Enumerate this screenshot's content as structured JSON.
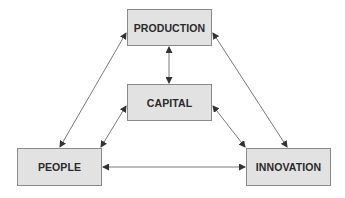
{
  "diagram": {
    "type": "relationship-triangle",
    "nodes": {
      "production": {
        "label": "PRODUCTION"
      },
      "capital": {
        "label": "CAPITAL"
      },
      "people": {
        "label": "PEOPLE"
      },
      "innovation": {
        "label": "INNOVATION"
      }
    },
    "edges": [
      {
        "from": "PRODUCTION",
        "to": "CAPITAL",
        "direction": "bidirectional"
      },
      {
        "from": "PRODUCTION",
        "to": "PEOPLE",
        "direction": "bidirectional"
      },
      {
        "from": "PRODUCTION",
        "to": "INNOVATION",
        "direction": "bidirectional"
      },
      {
        "from": "CAPITAL",
        "to": "PEOPLE",
        "direction": "bidirectional"
      },
      {
        "from": "CAPITAL",
        "to": "INNOVATION",
        "direction": "bidirectional"
      },
      {
        "from": "PEOPLE",
        "to": "INNOVATION",
        "direction": "bidirectional"
      }
    ],
    "colors": {
      "box_fill": "#e2e2e2",
      "box_border": "#8a8a8a",
      "line": "#555555",
      "text": "#2a2a2a"
    }
  }
}
